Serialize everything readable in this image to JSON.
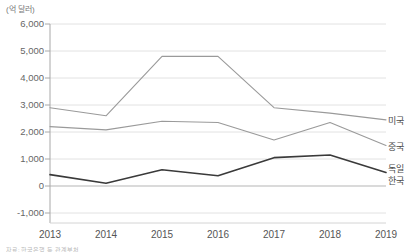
{
  "unit_label": "(억 달러)",
  "footnote": "자료: 한국은행 등 관계부처",
  "axis": {
    "y_ticks": [
      "6,000",
      "5,000",
      "4,000",
      "3,000",
      "2,000",
      "1,000",
      "0",
      "-1,000"
    ],
    "x_ticks": [
      "2013",
      "2014",
      "2015",
      "2016",
      "2017",
      "2018",
      "2019"
    ]
  },
  "legend": {
    "usa": "미국",
    "china": "중국",
    "germany": "독일",
    "korea": "한국"
  },
  "colors": {
    "gray_line": "#9a9a9a",
    "dark_line": "#3a3a3a",
    "grid": "#e2e2e2",
    "axis": "#a8a8a8"
  },
  "chart_data": {
    "type": "line",
    "title": "",
    "subtitle": "",
    "xlabel": "",
    "ylabel": "(억 달러)",
    "categories": [
      "2013",
      "2014",
      "2015",
      "2016",
      "2017",
      "2018",
      "2019"
    ],
    "ylim": [
      -1000,
      6000
    ],
    "ytick_step": 1000,
    "grid": true,
    "legend_position": "right-inline",
    "series": [
      {
        "name": "미국",
        "color": "#9a9a9a",
        "values": [
          2900,
          2600,
          4800,
          4800,
          2900,
          2700,
          2450
        ]
      },
      {
        "name": "중국",
        "color": "#9a9a9a",
        "values": [
          2200,
          2080,
          2400,
          2350,
          1700,
          2350,
          1500
        ]
      },
      {
        "name": "독일",
        "color": "#3a3a3a",
        "values": [
          420,
          100,
          600,
          380,
          1050,
          1150,
          500
        ]
      },
      {
        "name": "한국",
        "color": "#3a3a3a",
        "values": [
          420,
          100,
          600,
          380,
          1050,
          1150,
          500
        ]
      }
    ]
  }
}
